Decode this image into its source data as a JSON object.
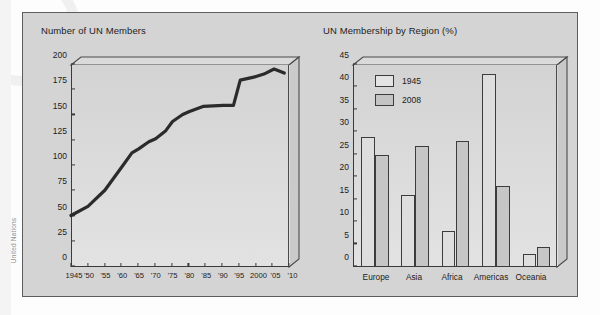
{
  "source_credit": "United Nations",
  "figure": {
    "panels": [
      {
        "id": "un-members-line",
        "title": "Number of UN Members"
      },
      {
        "id": "membership-by-region-bar",
        "title": "UN Membership by Region (%)"
      }
    ]
  },
  "chart_data": [
    {
      "type": "line",
      "title": "Number of UN Members",
      "xlabel": "",
      "ylabel": "",
      "ylim": [
        0,
        200
      ],
      "yticks": [
        0,
        25,
        50,
        75,
        100,
        125,
        150,
        175,
        200
      ],
      "ytick_labels": [
        "0",
        "25",
        "50",
        "75",
        "100",
        "125",
        "150",
        "175",
        "200"
      ],
      "xlim": [
        1945,
        2010
      ],
      "xticks": [
        1945,
        1950,
        1955,
        1960,
        1965,
        1970,
        1975,
        1980,
        1985,
        1990,
        1995,
        2000,
        2005,
        2010
      ],
      "xtick_labels": [
        "1945",
        "'50",
        "'55",
        "'60",
        "'65",
        "'70",
        "'75",
        "'80",
        "'85",
        "'90",
        "'95",
        "2000",
        "'05",
        "'10"
      ],
      "grid": false,
      "legend": null,
      "series": [
        {
          "name": "UN member states",
          "x": [
            1945,
            1950,
            1955,
            1960,
            1963,
            1965,
            1968,
            1970,
            1973,
            1975,
            1978,
            1980,
            1984,
            1990,
            1993,
            1995,
            1999,
            2002,
            2005,
            2008
          ],
          "values": [
            51,
            60,
            76,
            99,
            113,
            117,
            124,
            127,
            135,
            144,
            151,
            154,
            159,
            160,
            160,
            185,
            188,
            191,
            196,
            192
          ]
        }
      ]
    },
    {
      "type": "bar",
      "title": "UN Membership by Region (%)",
      "xlabel": "",
      "ylabel": "",
      "ylim": [
        0,
        45
      ],
      "yticks": [
        0,
        5,
        10,
        15,
        20,
        25,
        30,
        35,
        40,
        45
      ],
      "ytick_labels": [
        "0",
        "5",
        "10",
        "15",
        "20",
        "25",
        "30",
        "35",
        "40",
        "45"
      ],
      "grid": false,
      "legend_position": "top-left",
      "categories": [
        "Europe",
        "Asia",
        "Africa",
        "Americas",
        "Oceania"
      ],
      "series": [
        {
          "name": "1945",
          "values": [
            29,
            16,
            8,
            43,
            3
          ]
        },
        {
          "name": "2008",
          "values": [
            25,
            27,
            28,
            18,
            4.5
          ]
        }
      ]
    }
  ],
  "colors": {
    "page_background": "#fdfdfd",
    "figure_background": "#d4d4d4",
    "plot_fill": "#dcdcdc",
    "axis_line": "#3a3a3a",
    "line_series": "#2a2a2a",
    "bar_1945": "#dedede",
    "bar_2008": "#c6c6c6",
    "text": "#1c1c1c"
  }
}
